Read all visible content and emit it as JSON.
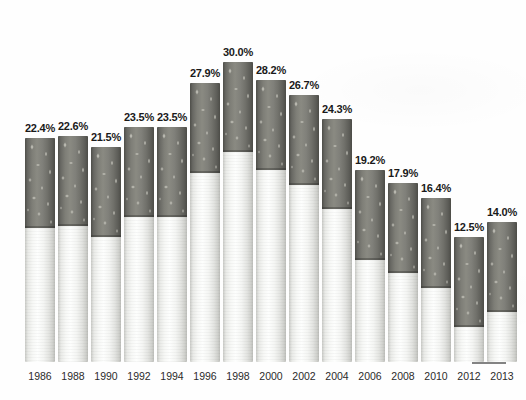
{
  "chart_data": {
    "type": "bar",
    "title": "",
    "subtitle": "",
    "xlabel": "",
    "ylabel": "",
    "categories": [
      "1986",
      "1988",
      "1990",
      "1992",
      "1994",
      "1996",
      "1998",
      "2000",
      "2002",
      "2004",
      "2006",
      "2008",
      "2010",
      "2012",
      "2013"
    ],
    "values": [
      22.4,
      22.6,
      21.5,
      23.5,
      23.5,
      27.9,
      30.0,
      28.2,
      26.7,
      24.3,
      19.2,
      17.9,
      16.4,
      12.5,
      14.0
    ],
    "value_labels": [
      "22.4%",
      "22.6%",
      "21.5%",
      "23.5%",
      "23.5%",
      "27.9%",
      "30.0%",
      "28.2%",
      "26.7%",
      "24.3%",
      "19.2%",
      "17.9%",
      "16.4%",
      "12.5%",
      "14.0%"
    ],
    "ylim": [
      0,
      30.0
    ],
    "grid": false,
    "legend": null,
    "annotations": [],
    "bar_style": "cigarette-pictogram",
    "colors": {
      "tobacco": "#7e7e77",
      "tobacco_dark_edge": "#4e4e49",
      "filter_paper": "#f7f8f6",
      "filter_paper_edge": "#c9cac6",
      "value_label_text": "#1a1a1a",
      "tick_label_text": "#2b2b2b",
      "background": "#fefefe"
    }
  },
  "layout": {
    "bar_width_px": 30,
    "bar_gap_px": 3,
    "plot_left_px": 25,
    "baseline_bottom_px": 38,
    "max_bar_height_px": 300,
    "tobacco_section_height_px": 90
  }
}
